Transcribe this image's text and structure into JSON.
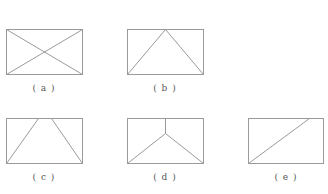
{
  "figures": [
    {
      "id": "a",
      "label": "( a )",
      "description": "rectangle with both diagonals"
    },
    {
      "id": "b",
      "label": "( b )",
      "description": "rectangle with triangle from bottom corners to top-middle"
    },
    {
      "id": "c",
      "label": "( c )",
      "description": "rectangle with trapezoid from bottom corners to two top points"
    },
    {
      "id": "d",
      "label": "( d )",
      "description": "rectangle with vertical from top-middle to interior point joined to bottom corners"
    },
    {
      "id": "e",
      "label": "( e )",
      "description": "rectangle with single diagonal from bottom-left toward top-right"
    }
  ],
  "colors": {
    "stroke": "#9a9a9a",
    "label": "#555555",
    "background": "#ffffff"
  }
}
